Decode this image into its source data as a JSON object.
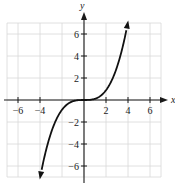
{
  "chart_data": {
    "type": "line",
    "title": "",
    "xlabel": "x",
    "ylabel": "y",
    "xlim": [
      -7,
      7
    ],
    "ylim": [
      -7,
      7
    ],
    "grid": true,
    "x_ticks": [
      -6,
      -4,
      2,
      4,
      6
    ],
    "y_ticks": [
      6,
      4,
      2,
      -2,
      -4,
      -6
    ],
    "x_tick_labels": [
      "−6",
      "−4",
      "2",
      "4",
      "6"
    ],
    "y_tick_labels": [
      "6",
      "4",
      "2",
      "−2",
      "−4",
      "−6"
    ],
    "series": [
      {
        "name": "f(x)",
        "description": "cubic-shaped curve, flat near origin, arrows at both ends",
        "x": [
          -4,
          -3,
          -2,
          -1,
          0,
          1,
          2,
          3,
          4
        ],
        "y": [
          -7.1,
          -3.0,
          -0.9,
          -0.1,
          0,
          0.1,
          0.9,
          3.0,
          7.1
        ],
        "arrow_ends": true
      }
    ]
  },
  "labels": {
    "x_axis": "x",
    "y_axis": "y"
  }
}
